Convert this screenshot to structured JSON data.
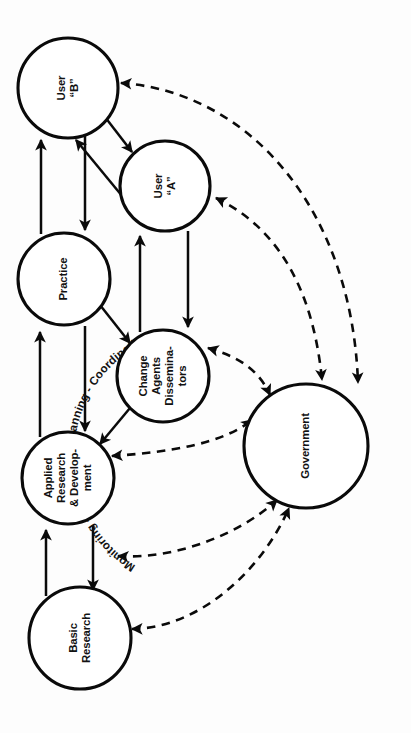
{
  "diagram": {
    "orientation": "rotated-90-ccw",
    "background_color": "#fdfdfd",
    "stroke_color": "#0a0a0a",
    "fill_color": "#ffffff",
    "nodes": [
      {
        "id": "user-b",
        "lines": [
          "User",
          "“B”"
        ],
        "cx": 68,
        "cy": 88,
        "r": 50,
        "has_inner_arrows": true,
        "inner_ring_r": 34,
        "inner_arrow_count": 12
      },
      {
        "id": "user-a",
        "lines": [
          "User",
          "“A”"
        ],
        "cx": 165,
        "cy": 186,
        "r": 45,
        "has_inner_arrows": true,
        "inner_ring_r": 31,
        "inner_arrow_count": 12
      },
      {
        "id": "practice",
        "lines": [
          "Practice"
        ],
        "cx": 64,
        "cy": 279,
        "r": 46,
        "has_inner_arrows": true,
        "inner_ring_r": 32,
        "inner_arrow_count": 12
      },
      {
        "id": "change-agents",
        "lines": [
          "Change",
          "Agents",
          "Dissemina-",
          "tors"
        ],
        "cx": 163,
        "cy": 376,
        "r": 46,
        "has_inner_arrows": true,
        "inner_ring_r": 32,
        "inner_arrow_count": 12
      },
      {
        "id": "applied-research",
        "lines": [
          "Applied",
          "Research",
          "& Develop-",
          "ment"
        ],
        "cx": 68,
        "cy": 478,
        "r": 46,
        "has_inner_arrows": true,
        "inner_ring_r": 32,
        "inner_arrow_count": 12
      },
      {
        "id": "basic-research",
        "lines": [
          "Basic",
          "Research"
        ],
        "cx": 80,
        "cy": 638,
        "r": 51,
        "has_inner_arrows": false,
        "inner_ring_r": 0,
        "inner_arrow_count": 0
      },
      {
        "id": "government",
        "lines": [
          "Government"
        ],
        "cx": 306,
        "cy": 446,
        "r": 62,
        "has_inner_arrows": true,
        "inner_ring_r": 43,
        "inner_arrow_count": 12
      }
    ],
    "curve_label": {
      "text": "Monitoring - Facilitating - Planning - Coordinating",
      "style": "dashed-curve-annotation"
    },
    "solid_links": [
      {
        "from": "practice",
        "to": "user-b",
        "style": "solid",
        "arrow": "single"
      },
      {
        "from": "user-b",
        "to": "practice",
        "style": "solid",
        "arrow": "single"
      },
      {
        "from": "user-b",
        "to": "user-a",
        "style": "solid",
        "arrow": "single"
      },
      {
        "from": "user-a",
        "to": "user-b",
        "style": "solid",
        "arrow": "single"
      },
      {
        "from": "change-agents",
        "to": "user-a",
        "style": "solid",
        "arrow": "single"
      },
      {
        "from": "user-a",
        "to": "change-agents",
        "style": "solid",
        "arrow": "single"
      },
      {
        "from": "applied-research",
        "to": "practice",
        "style": "solid",
        "arrow": "single"
      },
      {
        "from": "practice",
        "to": "applied-research",
        "style": "solid",
        "arrow": "single"
      },
      {
        "from": "practice",
        "to": "change-agents",
        "style": "solid",
        "arrow": "single"
      },
      {
        "from": "change-agents",
        "to": "applied-research",
        "style": "solid",
        "arrow": "single"
      },
      {
        "from": "basic-research",
        "to": "applied-research",
        "style": "solid",
        "arrow": "single"
      },
      {
        "from": "applied-research",
        "to": "basic-research",
        "style": "solid",
        "arrow": "single"
      }
    ],
    "dashed_links": [
      {
        "from": "government",
        "to": "user-b",
        "style": "dashed",
        "arrow": "double"
      },
      {
        "from": "government",
        "to": "user-a",
        "style": "dashed",
        "arrow": "double"
      },
      {
        "from": "government",
        "to": "change-agents",
        "style": "dashed",
        "arrow": "double"
      },
      {
        "from": "government",
        "to": "applied-research",
        "style": "dashed",
        "arrow": "double"
      },
      {
        "from": "government",
        "to": "basic-research",
        "style": "dashed",
        "arrow": "double"
      }
    ]
  }
}
